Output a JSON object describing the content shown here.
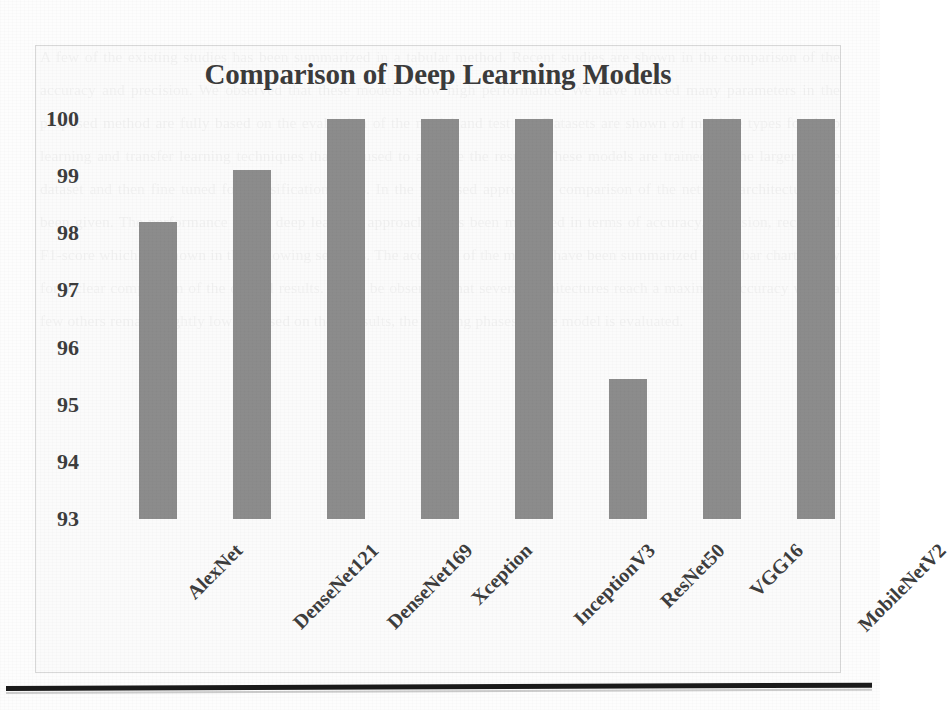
{
  "chart_data": {
    "type": "bar",
    "title": "Comparison of Deep Learning Models",
    "xlabel": "",
    "ylabel": "",
    "categories": [
      "AlexNet",
      "DenseNet121",
      "DenseNet169",
      "Xception",
      "InceptionV3",
      "ResNet50",
      "VGG16",
      "MobileNetV2"
    ],
    "values": [
      98.2,
      99.1,
      100,
      100,
      100,
      95.45,
      100,
      100
    ],
    "ylim": [
      93,
      100
    ],
    "yticks": [
      100,
      99,
      98,
      97,
      96,
      95,
      94,
      93
    ],
    "ytick_labels": [
      "100",
      "99",
      "98",
      "97",
      "96",
      "95",
      "94",
      "93"
    ],
    "grid": false,
    "legend": null,
    "bar_color": "#8c8c8c",
    "background_color": "#fafafa",
    "frame_color": "#d8d8d8",
    "text_color": "#3d3d3d"
  },
  "page": {
    "bleed_text": "A few of the existing studies has been summarized in a tabular method. Recent studies are shown in the comparison of the accuracy and precision. We observed that these models show high performance. We have noticed many parameters in the proposed method are fully based on the evaluation of the model and test set. Datasets are shown of multiple types for deep learning and transfer learning techniques that are used to analyze the results. These models are trained on the larger image dataset and then fine tuned for classification tasks. In the proposed approach a comparison of the network architecture has been given. The performance of the deep learning approaches has been measured in terms of accuracy, precision, recall and F1-score which are shown in the following sections. The accuracy of the models have been summarized in the bar chart below for a clear comparison of the overall results. It can be observed that several architectures reach a maximum accuracy while a few others remain slightly lower. Based on these results, the training phases of the model is evaluated."
  }
}
